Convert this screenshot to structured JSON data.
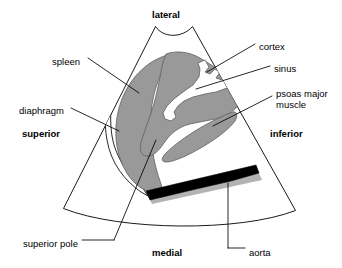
{
  "figure": {
    "type": "anatomical-ultrasound-diagram",
    "colors": {
      "background": "#ffffff",
      "outline": "#000000",
      "tissue_gray": "#999999",
      "tissue_gray_edge": "#6e6e6e",
      "sinus_white": "#ffffff",
      "aorta_black": "#000000",
      "aorta_shadow": "#9a9a9a",
      "leader_line": "#000000"
    },
    "scan_fan": {
      "name": "ultrasound-sector-fan",
      "description": "Trapezoid sector sweep with concave transducer face at top and convex arc at bottom"
    }
  },
  "orientation_labels": [
    {
      "id": "lateral",
      "text": "lateral",
      "bold": true,
      "x": 152,
      "y": 9,
      "align": "left"
    },
    {
      "id": "superior",
      "text": "superior",
      "bold": true,
      "x": 22,
      "y": 128,
      "align": "left"
    },
    {
      "id": "inferior",
      "text": "inferior",
      "bold": true,
      "x": 270,
      "y": 128,
      "align": "left"
    },
    {
      "id": "medial",
      "text": "medial",
      "bold": true,
      "x": 152,
      "y": 247,
      "align": "left"
    }
  ],
  "structure_labels": [
    {
      "id": "spleen",
      "text": "spleen",
      "lines": [
        "spleen"
      ],
      "x": 52,
      "y": 56,
      "align": "left"
    },
    {
      "id": "diaphragm",
      "text": "diaphragm",
      "lines": [
        "diaphragm"
      ],
      "x": 19,
      "y": 105,
      "align": "left"
    },
    {
      "id": "superior-pole",
      "text": "superior pole",
      "lines": [
        "superior pole"
      ],
      "x": 23,
      "y": 238,
      "align": "left"
    },
    {
      "id": "cortex",
      "text": "cortex",
      "lines": [
        "cortex"
      ],
      "x": 259,
      "y": 41,
      "align": "left"
    },
    {
      "id": "sinus",
      "text": "sinus",
      "lines": [
        "sinus"
      ],
      "x": 274,
      "y": 63,
      "align": "left"
    },
    {
      "id": "psoas-major-muscle",
      "text": "psoas major muscle",
      "lines": [
        "psoas major",
        "muscle"
      ],
      "x": 276,
      "y": 88,
      "align": "left"
    },
    {
      "id": "aorta",
      "text": "aorta",
      "lines": [
        "aorta"
      ],
      "x": 249,
      "y": 247,
      "align": "left"
    }
  ]
}
